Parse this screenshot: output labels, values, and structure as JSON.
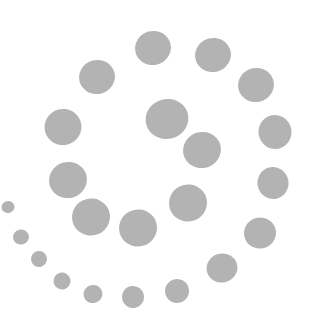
{
  "figure": {
    "dot_color": "#b3b3b3",
    "background": "#ffffff"
  },
  "dots": [
    {
      "x": 153,
      "y": 48,
      "w": 36,
      "h": 34
    },
    {
      "x": 213,
      "y": 55,
      "w": 36,
      "h": 34
    },
    {
      "x": 97,
      "y": 77,
      "w": 36,
      "h": 34
    },
    {
      "x": 256,
      "y": 85,
      "w": 36,
      "h": 34
    },
    {
      "x": 63,
      "y": 127,
      "w": 37,
      "h": 36
    },
    {
      "x": 167,
      "y": 119,
      "w": 43,
      "h": 40
    },
    {
      "x": 275,
      "y": 132,
      "w": 33,
      "h": 34
    },
    {
      "x": 202,
      "y": 150,
      "w": 38,
      "h": 36
    },
    {
      "x": 68,
      "y": 180,
      "w": 38,
      "h": 36
    },
    {
      "x": 273,
      "y": 183,
      "w": 31,
      "h": 32
    },
    {
      "x": 188,
      "y": 203,
      "w": 38,
      "h": 37
    },
    {
      "x": 8,
      "y": 207,
      "w": 13,
      "h": 12
    },
    {
      "x": 91,
      "y": 217,
      "w": 38,
      "h": 37
    },
    {
      "x": 138,
      "y": 228,
      "w": 38,
      "h": 37
    },
    {
      "x": 260,
      "y": 233,
      "w": 32,
      "h": 31
    },
    {
      "x": 21,
      "y": 237,
      "w": 16,
      "h": 15
    },
    {
      "x": 39,
      "y": 259,
      "w": 16,
      "h": 16
    },
    {
      "x": 222,
      "y": 268,
      "w": 31,
      "h": 29
    },
    {
      "x": 62,
      "y": 281,
      "w": 17,
      "h": 17
    },
    {
      "x": 177,
      "y": 291,
      "w": 24,
      "h": 24
    },
    {
      "x": 93,
      "y": 294,
      "w": 19,
      "h": 18
    },
    {
      "x": 133,
      "y": 297,
      "w": 22,
      "h": 22
    }
  ]
}
